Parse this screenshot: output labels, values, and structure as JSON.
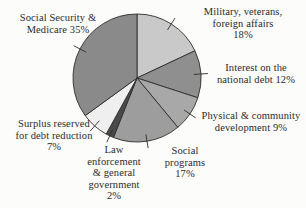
{
  "chart_data": {
    "type": "pie",
    "title": "",
    "subtitle": "",
    "xlabel": "",
    "ylabel": "",
    "legend_position": "none",
    "grid": false,
    "units": "percent",
    "total": 100,
    "start_angle_deg": 0,
    "direction": "clockwise",
    "categories": [
      "Military, veterans, foreign affairs",
      "Interest on the national debt",
      "Physical & community development",
      "Social programs",
      "Law enforcement & general government",
      "Surplus reserved for debt reduction",
      "Social Security & Medicare"
    ],
    "values": [
      18,
      12,
      9,
      17,
      2,
      7,
      35
    ],
    "slice_colors": [
      "#c9c9c9",
      "#8f8f8f",
      "#a8a8a8",
      "#9d9d9d",
      "#4a4a4a",
      "#efefef",
      "#8a8a8a"
    ],
    "slice_stroke": "#2e2e2e",
    "labels": [
      {
        "id": "military",
        "text": "Military, veterans,\nforeign affairs\n18%",
        "value": 18,
        "percent_text": "18%"
      },
      {
        "id": "interest",
        "text": "Interest on the\nnational debt  12%",
        "value": 12,
        "percent_text": "12%"
      },
      {
        "id": "physical",
        "text": "Physical & community\ndevelopment  9%",
        "value": 9,
        "percent_text": "9%"
      },
      {
        "id": "social",
        "text": "Social\nprograms\n17%",
        "value": 17,
        "percent_text": "17%"
      },
      {
        "id": "law",
        "text": "Law\nenforcement\n& general\ngovernment\n2%",
        "value": 2,
        "percent_text": "2%"
      },
      {
        "id": "surplus",
        "text": "Surplus reserved\nfor debt reduction\n7%",
        "value": 7,
        "percent_text": "7%"
      },
      {
        "id": "ssm",
        "text": "Social Security &\nMedicare  35%",
        "value": 35,
        "percent_text": "35%"
      }
    ]
  },
  "colors": {
    "background": "#fcfcfa",
    "text": "#2b2b2b",
    "outline": "#2e2e2e"
  }
}
